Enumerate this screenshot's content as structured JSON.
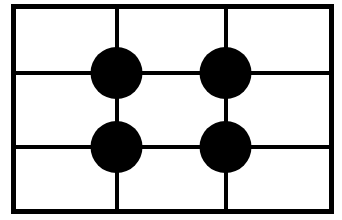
{
  "figure": {
    "canvas": {
      "width": 342,
      "height": 220,
      "background_color": "#ffffff"
    },
    "stroke_color": "#000000",
    "fill_color": "#000000",
    "frame": {
      "name": "outer-rectangle-frame",
      "x": 13.5,
      "y": 6.5,
      "width": 318,
      "height": 205,
      "stroke_width": 5
    },
    "grid": {
      "vertical_lines": [
        {
          "label": "vertical-line-1",
          "x": 116.5,
          "y1": 6.5,
          "y2": 211.5
        },
        {
          "label": "vertical-line-2",
          "x": 225.5,
          "y1": 6.5,
          "y2": 211.5
        }
      ],
      "horizontal_lines": [
        {
          "label": "horizontal-line-1",
          "y": 73,
          "x1": 13.5,
          "x2": 331.5
        },
        {
          "label": "horizontal-line-2",
          "y": 147,
          "x1": 13.5,
          "x2": 331.5
        }
      ],
      "line_stroke_width": 4,
      "columns": 3,
      "rows": 3
    },
    "dots": [
      {
        "label": "dot-top-left",
        "cx": 116.5,
        "cy": 73,
        "r": 26
      },
      {
        "label": "dot-top-right",
        "cx": 225.5,
        "cy": 73,
        "r": 26
      },
      {
        "label": "dot-bottom-left",
        "cx": 116.5,
        "cy": 147,
        "r": 26
      },
      {
        "label": "dot-bottom-right",
        "cx": 225.5,
        "cy": 147,
        "r": 26
      }
    ],
    "dot_count": 4
  }
}
